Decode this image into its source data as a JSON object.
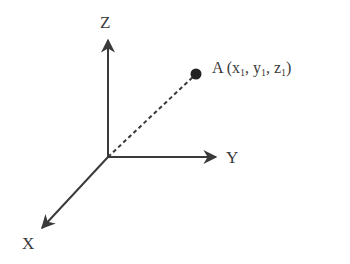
{
  "diagram": {
    "type": "3d-coordinate-axes",
    "axes": {
      "z": {
        "label": "Z"
      },
      "y": {
        "label": "Y"
      },
      "x": {
        "label": "X"
      }
    },
    "point": {
      "name": "A",
      "coord_1": "x",
      "coord_2": "y",
      "coord_3": "z",
      "subscript": "1",
      "open_paren": " (",
      "sep": ", ",
      "close_paren": ")"
    },
    "colors": {
      "axis": "#3a3a3a",
      "point": "#222222",
      "text": "#3a3a3a"
    }
  }
}
